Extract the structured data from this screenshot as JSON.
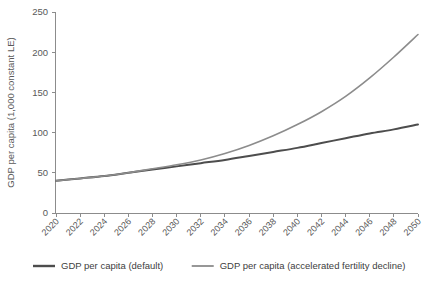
{
  "chart_data": {
    "type": "line",
    "title": "",
    "xlabel": "",
    "ylabel": "GDP per capita (1,000 constant LE)",
    "xlim": [
      2020,
      2050
    ],
    "ylim": [
      0,
      250
    ],
    "grid": false,
    "legend_position": "bottom",
    "x": [
      2020,
      2022,
      2024,
      2026,
      2028,
      2030,
      2032,
      2034,
      2036,
      2038,
      2040,
      2042,
      2044,
      2046,
      2048,
      2050
    ],
    "xtick_labels": [
      "2020",
      "2022",
      "2024",
      "2026",
      "2028",
      "2030",
      "2032",
      "2034",
      "2036",
      "2038",
      "2040",
      "2042",
      "2044",
      "2046",
      "2048",
      "2050"
    ],
    "ytick_labels": [
      "0",
      "50",
      "100",
      "150",
      "200",
      "250"
    ],
    "yticks": [
      0,
      50,
      100,
      150,
      200,
      250
    ],
    "series": [
      {
        "name": "GDP per capita (default)",
        "color": "#4d4d4d",
        "width": 2.0,
        "values": [
          40,
          43,
          46,
          50,
          54,
          58,
          62,
          66,
          71,
          76,
          81,
          87,
          93,
          99,
          104,
          110
        ]
      },
      {
        "name": "GDP per capita (accelerated fertility decline)",
        "color": "#8c8c8c",
        "width": 1.6,
        "values": [
          40,
          43,
          46,
          50,
          55,
          60,
          66,
          74,
          84,
          96,
          110,
          126,
          145,
          168,
          194,
          222
        ]
      }
    ]
  },
  "axis": {
    "y_title": "GDP per capita (1,000 constant LE)"
  },
  "legend": {
    "items": [
      {
        "label": "GDP per capita (default)",
        "color": "#4d4d4d"
      },
      {
        "label": "GDP per capita (accelerated fertility decline)",
        "color": "#8c8c8c"
      }
    ]
  },
  "clipped_header": ""
}
